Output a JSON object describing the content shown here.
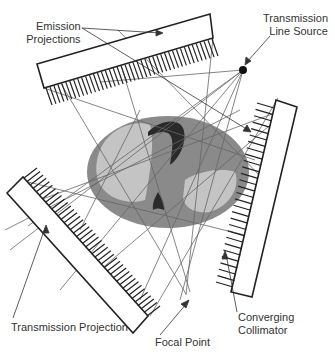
{
  "diagram": {
    "labels": {
      "emission": [
        "Emission",
        "Projections"
      ],
      "line_source": [
        "Transmission",
        "Line Source"
      ],
      "transmission_projection": "Transmission Projection",
      "focal_point": "Focal Point",
      "collimator": [
        "Converging",
        "Collimator"
      ]
    },
    "colors": {
      "body_outer": "#8a8a8a",
      "body_inner": "#c4c4c4",
      "organ_dark": "#2a2a2a",
      "line": "#222222",
      "ray": "#666666"
    }
  }
}
